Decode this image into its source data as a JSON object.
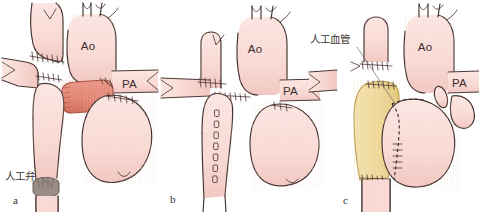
{
  "figure": {
    "background_color": "#ffffff",
    "width": 479,
    "height": 212
  },
  "palette": {
    "tissue_fill": "#fadbd6",
    "tissue_fill_light": "#fce6e2",
    "tissue_shadow": "#f0c2bc",
    "outline": "#43332f",
    "salmon_graft": "#e8897a",
    "salmon_graft_dark": "#d8705f",
    "tan_graft": "#f0dca0",
    "tan_graft_dark": "#e2c87e",
    "valve_gray": "#9c8e88",
    "valve_gray_dark": "#7e716b",
    "leader_line": "#6d6f76",
    "text": "#3a2f2c"
  },
  "panels": [
    {
      "id": "panel-a",
      "letter": "a",
      "letter_pos": {
        "x": 13,
        "y": 204
      },
      "labels": [
        {
          "name": "aorta-label",
          "text": "Ao",
          "x": 88,
          "y": 50
        },
        {
          "name": "pulmonary-artery-label",
          "text": "PA",
          "x": 122,
          "y": 88
        }
      ],
      "callouts": [
        {
          "name": "prosthetic-valve-callout",
          "text": "人工弁",
          "text_x": 5,
          "text_y": 180,
          "leader": {
            "x1": 40,
            "y1": 177,
            "x2": 51,
            "y2": 185
          }
        }
      ],
      "graft": {
        "kind": "conduit",
        "color_key": "salmon_graft",
        "description": "ribbed salmon interposition conduit"
      },
      "valve": {
        "kind": "prosthetic-valve-disc",
        "color_key": "valve_gray"
      }
    },
    {
      "id": "panel-b",
      "letter": "b",
      "letter_pos": {
        "x": 170,
        "y": 203
      },
      "labels": [
        {
          "name": "aorta-label",
          "text": "Ao",
          "x": 255,
          "y": 53
        },
        {
          "name": "pulmonary-artery-label",
          "text": "PA",
          "x": 283,
          "y": 95
        }
      ],
      "callouts": [],
      "graft": {
        "kind": "none",
        "description": "native vessels with running suture line only"
      }
    },
    {
      "id": "panel-c",
      "letter": "c",
      "letter_pos": {
        "x": 343,
        "y": 204
      },
      "labels": [
        {
          "name": "aorta-label",
          "text": "Ao",
          "x": 425,
          "y": 51
        },
        {
          "name": "pulmonary-artery-label",
          "text": "PA",
          "x": 452,
          "y": 87
        }
      ],
      "callouts": [
        {
          "name": "prosthetic-vessel-callout",
          "text": "人工血管",
          "text_x": 310,
          "text_y": 43,
          "leader": {
            "x1": 357,
            "y1": 47,
            "x2": 396,
            "y2": 105
          }
        }
      ],
      "graft": {
        "kind": "tube-graft",
        "color_key": "tan_graft",
        "description": "tan prosthetic vascular graft sewn alongside"
      }
    }
  ]
}
